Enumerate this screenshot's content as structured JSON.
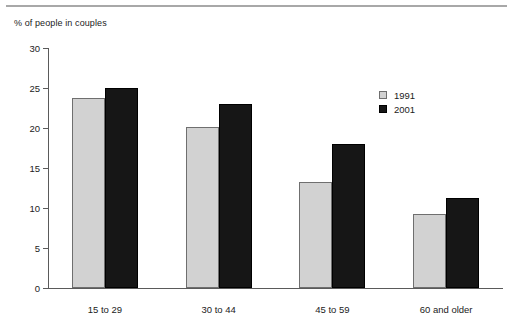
{
  "axis_title": "% of people in couples",
  "legend": {
    "entries": [
      {
        "label": "1991",
        "color": "#d2d2d2"
      },
      {
        "label": "2001",
        "color": "#161616"
      }
    ]
  },
  "y_ticks": [
    "0",
    "5",
    "10",
    "15",
    "20",
    "25",
    "30"
  ],
  "categories": [
    "15 to 29",
    "30 to 44",
    "45 to 59",
    "60 and older"
  ],
  "chart_data": {
    "type": "bar",
    "title": "",
    "subtitle": "",
    "xlabel": "",
    "ylabel": "% of people in couples",
    "categories": [
      "15 to 29",
      "30 to 44",
      "45 to 59",
      "60 and older"
    ],
    "series": [
      {
        "name": "1991",
        "color": "#d2d2d2",
        "values": [
          23.8,
          20.1,
          13.3,
          9.3
        ]
      },
      {
        "name": "2001",
        "color": "#161616",
        "values": [
          25.0,
          23.0,
          18.0,
          11.3
        ]
      }
    ],
    "ylim": [
      0,
      30
    ],
    "ytick_step": 5,
    "ytick_labels": [
      "0",
      "5",
      "10",
      "15",
      "20",
      "25",
      "30"
    ],
    "grid": false,
    "legend_position": "upper-right-inside"
  }
}
